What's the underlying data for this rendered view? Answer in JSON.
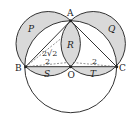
{
  "diagram": {
    "points": {
      "A": {
        "label": "A",
        "x": 70.7,
        "y": 20.7
      },
      "B": {
        "label": "B",
        "x": 25.7,
        "y": 66.7
      },
      "C": {
        "label": "C",
        "x": 116.7,
        "y": 66.7
      },
      "O": {
        "label": "O",
        "x": 70.7,
        "y": 66.7
      }
    },
    "regions": {
      "P": "P",
      "Q": "Q",
      "R": "R",
      "S": "S",
      "T": "T"
    },
    "measures": {
      "left_segment": "2",
      "right_segment": "2",
      "diagonal": "2√2"
    },
    "colors": {
      "shade": "#d9d9d9",
      "stroke": "#333333",
      "dash": "#666666",
      "background": "#ffffff"
    }
  }
}
